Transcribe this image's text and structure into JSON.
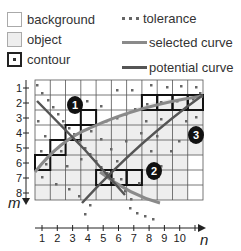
{
  "legend": {
    "background": "background",
    "object": "object",
    "contour": "contour",
    "tolerance": "tolerance",
    "selected_curve": "selected curve",
    "potential_curve": "potential curve"
  },
  "colors": {
    "background": "#ffffff",
    "object": "#eeeeee",
    "grid": "#555555",
    "contour": "#111111",
    "selected_curve": "#8a8a8a",
    "potential_curve": "#555555",
    "tolerance": "#666666",
    "marker": "#111111"
  },
  "axes": {
    "x_label": "n",
    "y_label": "m",
    "x_ticks": [
      "1",
      "2",
      "3",
      "4",
      "5",
      "6",
      "7",
      "8",
      "9",
      "10"
    ],
    "y_ticks": [
      "1",
      "2",
      "3",
      "4",
      "5",
      "6",
      "7",
      "8"
    ]
  },
  "grid": {
    "columns": 11,
    "rows": 8
  },
  "markers": [
    {
      "label": "1"
    },
    {
      "label": "2"
    },
    {
      "label": "3"
    }
  ],
  "contour_cells": [
    [
      2,
      8
    ],
    [
      2,
      9
    ],
    [
      2,
      10
    ],
    [
      2,
      11
    ],
    [
      3,
      4
    ],
    [
      4,
      3
    ],
    [
      5,
      2
    ],
    [
      6,
      1
    ],
    [
      7,
      5
    ],
    [
      7,
      6
    ],
    [
      7,
      7
    ]
  ]
}
